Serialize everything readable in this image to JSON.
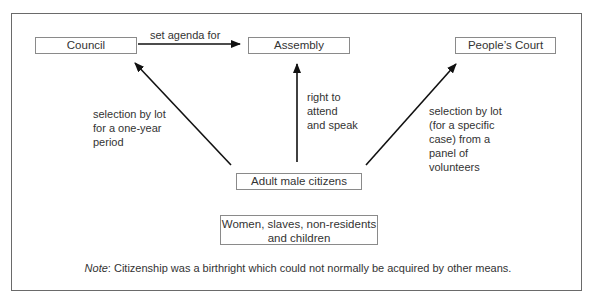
{
  "diagram": {
    "nodes": {
      "council": "Council",
      "assembly": "Assembly",
      "peoples_court": "People’s Court",
      "citizens": "Adult male citizens",
      "excluded_line1": "Women, slaves, non-residents",
      "excluded_line2": "and children"
    },
    "edges": {
      "council_to_assembly": "set agenda for",
      "citizens_to_council": [
        "selection by lot",
        "for a one-year",
        "period"
      ],
      "citizens_to_assembly": [
        "right to",
        "attend",
        "and speak"
      ],
      "citizens_to_court": [
        "selection by lot",
        "(for a specific",
        "case) from a",
        "panel of",
        "volunteers"
      ]
    },
    "note": {
      "label": "Note",
      "text": ": Citizenship was a birthright which could not normally be acquired by other means."
    }
  }
}
